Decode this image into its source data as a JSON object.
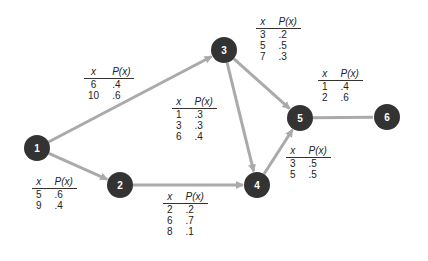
{
  "diagram": {
    "type": "network",
    "colors": {
      "node_fill": "#333333",
      "node_text": "#ffffff",
      "edge": "#aaaaaa",
      "text": "#222222"
    },
    "nodes": [
      {
        "id": "1",
        "label": "1",
        "x": 37,
        "y": 148
      },
      {
        "id": "2",
        "label": "2",
        "x": 120,
        "y": 185
      },
      {
        "id": "3",
        "label": "3",
        "x": 224,
        "y": 50
      },
      {
        "id": "4",
        "label": "4",
        "x": 257,
        "y": 185
      },
      {
        "id": "5",
        "label": "5",
        "x": 300,
        "y": 118
      },
      {
        "id": "6",
        "label": "6",
        "x": 387,
        "y": 117
      }
    ],
    "edges": [
      {
        "from": "1",
        "to": "3",
        "arrow": true
      },
      {
        "from": "1",
        "to": "2",
        "arrow": true
      },
      {
        "from": "2",
        "to": "4",
        "arrow": true
      },
      {
        "from": "3",
        "to": "4",
        "arrow": true
      },
      {
        "from": "3",
        "to": "5",
        "arrow": true
      },
      {
        "from": "4",
        "to": "5",
        "arrow": true
      },
      {
        "from": "5",
        "to": "6",
        "arrow": false
      }
    ],
    "header": {
      "x": "x",
      "p": "P(x)"
    },
    "tables": [
      {
        "edge": "1-3",
        "rows": [
          {
            "x": "6",
            "p": ".4"
          },
          {
            "x": "10",
            "p": ".6"
          }
        ]
      },
      {
        "edge": "3-5",
        "rows": [
          {
            "x": "3",
            "p": ".2"
          },
          {
            "x": "5",
            "p": ".5"
          },
          {
            "x": "7",
            "p": ".3"
          }
        ]
      },
      {
        "edge": "5-6",
        "rows": [
          {
            "x": "1",
            "p": ".4"
          },
          {
            "x": "2",
            "p": ".6"
          }
        ]
      },
      {
        "edge": "3-4",
        "rows": [
          {
            "x": "1",
            "p": ".3"
          },
          {
            "x": "3",
            "p": ".3"
          },
          {
            "x": "6",
            "p": ".4"
          }
        ]
      },
      {
        "edge": "1-2",
        "rows": [
          {
            "x": "5",
            "p": ".6"
          },
          {
            "x": "9",
            "p": ".4"
          }
        ]
      },
      {
        "edge": "2-4",
        "rows": [
          {
            "x": "2",
            "p": ".2"
          },
          {
            "x": "6",
            "p": ".7"
          },
          {
            "x": "8",
            "p": ".1"
          }
        ]
      },
      {
        "edge": "4-5",
        "rows": [
          {
            "x": "3",
            "p": ".5"
          },
          {
            "x": "5",
            "p": ".5"
          }
        ]
      }
    ]
  }
}
